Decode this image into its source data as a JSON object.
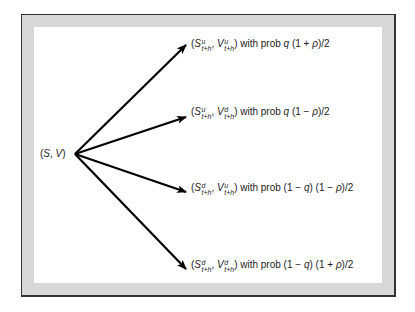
{
  "diagram": {
    "type": "branching-tree",
    "colors": {
      "frame_border": "#333333",
      "frame_band": "#d8d8d8",
      "panel": "#ffffff",
      "arrow": "#000000",
      "text": "#222222"
    },
    "origin": {
      "label": "(S, V)",
      "S": "S",
      "V": "V",
      "point": [
        75,
        154
      ]
    },
    "branches": [
      {
        "id": "uu",
        "S_sup": "u",
        "V_sup": "u",
        "sub": "t+h",
        "with_prob": "with prob",
        "prob_prefix": "q",
        "prob_expr": "(1 + ρ)/2",
        "tip": [
          186,
          45
        ],
        "label_pos": [
          191,
          38
        ]
      },
      {
        "id": "ud",
        "S_sup": "u",
        "V_sup": "d",
        "sub": "t+h",
        "with_prob": "with prob",
        "prob_prefix": "q",
        "prob_expr": "(1 − ρ)/2",
        "tip": [
          186,
          117
        ],
        "label_pos": [
          191,
          106
        ]
      },
      {
        "id": "du",
        "S_sup": "d",
        "V_sup": "u",
        "sub": "t+h",
        "with_prob": "with prob",
        "prob_prefix": "(1 − q)",
        "prob_expr": "(1 − ρ)/2",
        "tip": [
          186,
          192
        ],
        "label_pos": [
          191,
          182
        ]
      },
      {
        "id": "dd",
        "S_sup": "d",
        "V_sup": "d",
        "sub": "t+h",
        "with_prob": "with prob",
        "prob_prefix": "(1 − q)",
        "prob_expr": "(1 + ρ)/2",
        "tip": [
          186,
          269
        ],
        "label_pos": [
          191,
          259
        ]
      }
    ]
  }
}
